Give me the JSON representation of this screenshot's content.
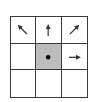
{
  "diagram": {
    "type": "3x3-neighborhood-grid",
    "rows": 3,
    "cols": 3,
    "line_color": "#3a3a3a",
    "center_fill": "#bdbdbd",
    "cells": [
      [
        {
          "icon": "arrow-up-left-icon"
        },
        {
          "icon": "arrow-up-icon"
        },
        {
          "icon": "arrow-up-right-icon"
        }
      ],
      [
        {
          "icon": "none"
        },
        {
          "icon": "dot-icon",
          "highlighted": true
        },
        {
          "icon": "arrow-right-icon"
        }
      ],
      [
        {
          "icon": "none"
        },
        {
          "icon": "none"
        },
        {
          "icon": "none"
        }
      ]
    ]
  }
}
